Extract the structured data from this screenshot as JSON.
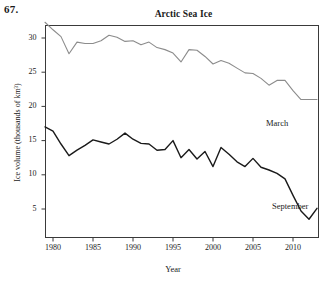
{
  "problem_number": "67.",
  "axis": {
    "y_title": "Ice volume (thousands of km³)",
    "x_title": "Year",
    "y_ticks": [
      5,
      10,
      15,
      20,
      25,
      30
    ],
    "x_ticks": [
      1980,
      1985,
      1990,
      1995,
      2000,
      2005,
      2010
    ]
  },
  "labels": {
    "march": "March",
    "september": "September"
  },
  "colors": {
    "march_line": "#8c8c8c",
    "september_line": "#1a1a1a",
    "axis": "#3a3a3a",
    "background": "#ffffff"
  },
  "chart_data": {
    "type": "line",
    "title": "Arctic Sea Ice",
    "xlabel": "Year",
    "ylabel": "Ice volume (thousands of km³)",
    "xlim": [
      1979,
      2013
    ],
    "ylim": [
      3,
      32.5
    ],
    "grid": false,
    "legend": "inline-labels-right",
    "x": [
      1979,
      1980,
      1981,
      1982,
      1983,
      1984,
      1985,
      1986,
      1987,
      1988,
      1989,
      1990,
      1991,
      1992,
      1993,
      1994,
      1995,
      1996,
      1997,
      1998,
      1999,
      2000,
      2001,
      2002,
      2003,
      2004,
      2005,
      2006,
      2007,
      2008,
      2009,
      2010,
      2011,
      2012,
      2013
    ],
    "series": [
      {
        "name": "March",
        "color": "#8c8c8c",
        "values": [
          32.3,
          31.4,
          30.3,
          29.0,
          27.7,
          29.4,
          29.2,
          29.2,
          29.6,
          29.9,
          30.4,
          30.1,
          29.5,
          29.6,
          29.0,
          29.3,
          28.5,
          27.8,
          28.0,
          26.5,
          27.8,
          28.3,
          28.2,
          27.3,
          26.2,
          26.4,
          26.7,
          25.6,
          24.9,
          24.9,
          24.2,
          23.1,
          23.8,
          23.8,
          21.0
        ]
      },
      {
        "name": "September",
        "color": "#1a1a1a",
        "values": [
          17.0,
          16.6,
          15.0,
          12.8,
          13.6,
          14.2,
          15.1,
          14.7,
          14.5,
          14.9,
          15.6,
          16.1,
          15.6,
          15.3,
          14.8,
          14.6,
          14.0,
          13.6,
          13.8,
          15.0,
          12.5,
          13.8,
          12.8,
          11.2,
          12.6,
          14.0,
          13.0,
          12.0,
          11.5,
          11.2,
          12.4,
          11.5,
          11.0,
          10.5,
          9.4
        ]
      }
    ]
  },
  "march_points": [
    [
      1979,
      32.3
    ],
    [
      1980,
      31.2
    ],
    [
      1981,
      30.2
    ],
    [
      1982,
      27.7
    ],
    [
      1983,
      29.4
    ],
    [
      1984,
      29.2
    ],
    [
      1985,
      29.2
    ],
    [
      1986,
      29.6
    ],
    [
      1987,
      30.4
    ],
    [
      1988,
      30.1
    ],
    [
      1989,
      29.5
    ],
    [
      1990,
      29.6
    ],
    [
      1991,
      29.0
    ],
    [
      1992,
      29.4
    ],
    [
      1993,
      28.6
    ],
    [
      1994,
      28.3
    ],
    [
      1995,
      27.8
    ],
    [
      1996,
      26.5
    ],
    [
      1997,
      28.3
    ],
    [
      1998,
      28.2
    ],
    [
      1999,
      27.3
    ],
    [
      2000,
      26.2
    ],
    [
      2001,
      26.7
    ],
    [
      2002,
      26.3
    ],
    [
      2003,
      25.6
    ],
    [
      2004,
      24.9
    ],
    [
      2005,
      24.8
    ],
    [
      2006,
      24.1
    ],
    [
      2007,
      23.1
    ],
    [
      2008,
      23.8
    ],
    [
      2009,
      23.8
    ],
    [
      2010,
      22.3
    ],
    [
      2011,
      21.0
    ],
    [
      2012,
      21.0
    ],
    [
      2013,
      21.0
    ]
  ],
  "september_points": [
    [
      1979,
      17.0
    ],
    [
      1980,
      16.4
    ],
    [
      1981,
      14.5
    ],
    [
      1982,
      12.8
    ],
    [
      1983,
      13.6
    ],
    [
      1984,
      14.3
    ],
    [
      1985,
      15.1
    ],
    [
      1986,
      14.8
    ],
    [
      1987,
      14.5
    ],
    [
      1988,
      15.2
    ],
    [
      1989,
      16.1
    ],
    [
      1990,
      15.2
    ],
    [
      1991,
      14.6
    ],
    [
      1992,
      14.5
    ],
    [
      1993,
      13.6
    ],
    [
      1994,
      13.7
    ],
    [
      1995,
      15.0
    ],
    [
      1996,
      12.5
    ],
    [
      1997,
      13.7
    ],
    [
      1998,
      12.3
    ],
    [
      1999,
      13.4
    ],
    [
      2000,
      11.2
    ],
    [
      2001,
      14.0
    ],
    [
      2002,
      13.0
    ],
    [
      2003,
      11.9
    ],
    [
      2004,
      11.2
    ],
    [
      2005,
      12.4
    ],
    [
      2006,
      11.1
    ],
    [
      2007,
      10.7
    ],
    [
      2008,
      10.2
    ],
    [
      2009,
      9.4
    ],
    [
      2010,
      9.3
    ],
    [
      2011,
      6.5
    ],
    [
      2012,
      7.2
    ],
    [
      2013,
      7.0
    ]
  ],
  "september_tail": [
    [
      2010,
      7.0
    ],
    [
      2011,
      4.7
    ],
    [
      2012,
      3.5
    ],
    [
      2013,
      5.1
    ]
  ]
}
